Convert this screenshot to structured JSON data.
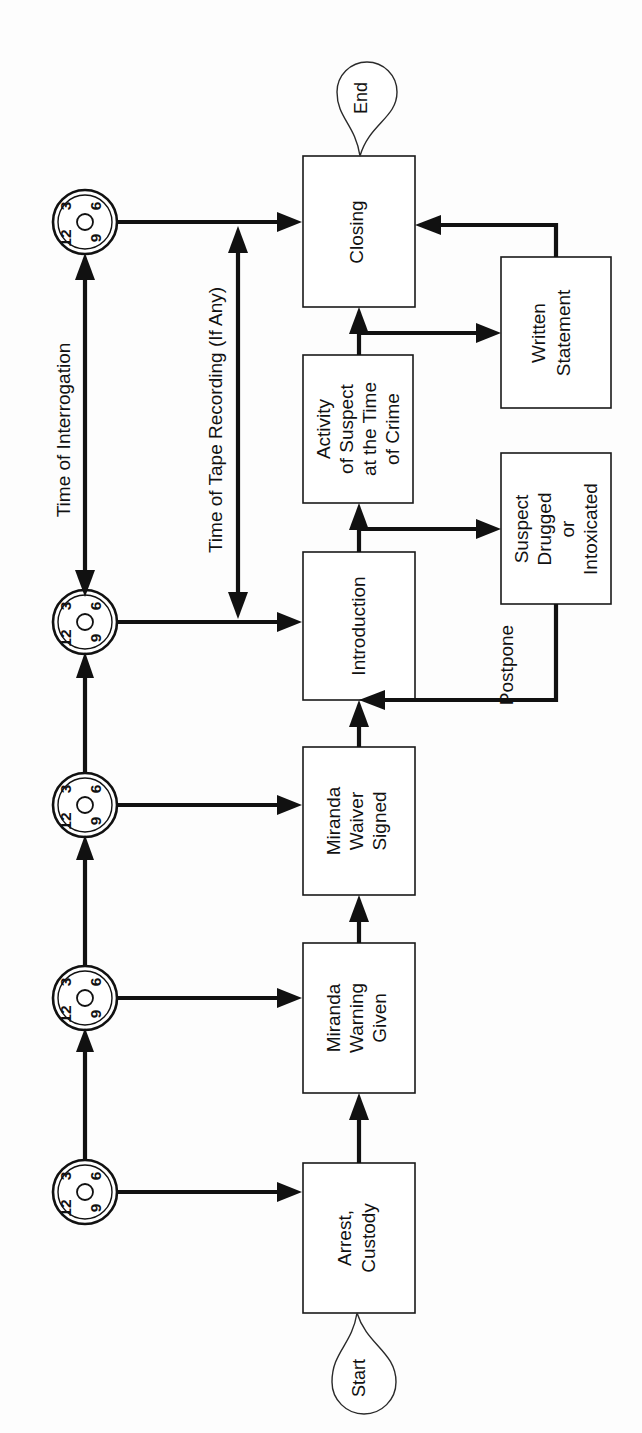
{
  "diagram": {
    "orientation": "rotated-90-ccw",
    "colors": {
      "background": "#fdfdfd",
      "stroke": "#111111",
      "box_fill": "#ffffff",
      "text": "#111111"
    },
    "terminators": [
      {
        "id": "start",
        "label": "Start"
      },
      {
        "id": "end",
        "label": "End"
      }
    ],
    "process_boxes": [
      {
        "id": "arrest-custody",
        "label_lines": [
          "Arrest,",
          "Custody"
        ]
      },
      {
        "id": "miranda-warning-given",
        "label_lines": [
          "Miranda",
          "Warning",
          "Given"
        ]
      },
      {
        "id": "miranda-waiver-signed",
        "label_lines": [
          "Miranda",
          "Waiver",
          "Signed"
        ]
      },
      {
        "id": "introduction",
        "label_lines": [
          "Introduction"
        ]
      },
      {
        "id": "activity-of-suspect",
        "label_lines": [
          "Activity",
          "of Suspect",
          "at the Time",
          "of Crime"
        ]
      },
      {
        "id": "closing",
        "label_lines": [
          "Closing"
        ]
      },
      {
        "id": "suspect-drugged",
        "label_lines": [
          "Suspect",
          "Drugged",
          "or",
          "Intoxicated"
        ]
      },
      {
        "id": "written-statement",
        "label_lines": [
          "Written",
          "Statement"
        ]
      }
    ],
    "edge_labels": [
      {
        "id": "postpone",
        "label": "Postpone"
      },
      {
        "id": "time-of-interrogation",
        "label": "Time of Interrogation"
      },
      {
        "id": "time-of-tape-recording",
        "label": "Time of Tape Recording (If Any)"
      }
    ],
    "clocks": {
      "count": 5,
      "face_numbers": [
        "12",
        "3",
        "6",
        "9"
      ],
      "labels": [
        "clock-arrest-custody",
        "clock-miranda-warning",
        "clock-miranda-waiver",
        "clock-introduction",
        "clock-closing"
      ]
    }
  }
}
